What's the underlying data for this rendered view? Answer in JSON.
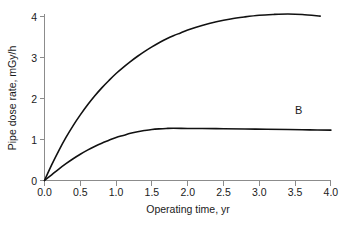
{
  "chart_data": {
    "type": "line",
    "title": "",
    "xlabel": "Operating time, yr",
    "ylabel": "Pipe dose rate, mGy/h",
    "xlim": [
      0.0,
      4.0
    ],
    "ylim": [
      0,
      4
    ],
    "grid": false,
    "legend_position": "inline-right-of-curve",
    "xticklabels": [
      "0.0",
      "0.5",
      "1.0",
      "1.5",
      "2.0",
      "2.5",
      "3.0",
      "3.5",
      "4.0"
    ],
    "xtickvalues": [
      0.0,
      0.5,
      1.0,
      1.5,
      2.0,
      2.5,
      3.0,
      3.5,
      4.0
    ],
    "yticklabels": [
      "0",
      "1",
      "2",
      "3",
      "4"
    ],
    "ytickvalues": [
      0,
      1,
      2,
      3,
      4
    ],
    "series": [
      {
        "name": "A",
        "label": "A",
        "color": "#111111",
        "x": [
          0.0,
          0.1,
          0.2,
          0.3,
          0.4,
          0.5,
          0.6,
          0.7,
          0.8,
          0.9,
          1.0,
          1.1,
          1.2,
          1.3,
          1.4,
          1.5,
          1.6,
          1.7,
          1.8,
          1.9,
          2.0,
          2.2,
          2.4,
          2.6,
          2.8,
          3.0,
          3.2,
          3.4,
          3.6,
          3.85
        ],
        "values": [
          0.0,
          0.38,
          0.73,
          1.05,
          1.34,
          1.6,
          1.84,
          2.06,
          2.26,
          2.44,
          2.61,
          2.76,
          2.9,
          3.03,
          3.15,
          3.26,
          3.36,
          3.45,
          3.53,
          3.6,
          3.67,
          3.78,
          3.87,
          3.94,
          3.99,
          4.03,
          4.05,
          4.06,
          4.05,
          4.01
        ]
      },
      {
        "name": "B",
        "label": "B",
        "color": "#111111",
        "x": [
          0.0,
          0.1,
          0.2,
          0.3,
          0.4,
          0.5,
          0.6,
          0.7,
          0.8,
          0.9,
          1.0,
          1.1,
          1.2,
          1.3,
          1.4,
          1.5,
          1.6,
          1.7,
          1.8,
          2.0,
          2.2,
          2.5,
          2.8,
          3.1,
          3.4,
          3.7,
          4.0
        ],
        "values": [
          0.0,
          0.14,
          0.28,
          0.41,
          0.53,
          0.64,
          0.74,
          0.83,
          0.91,
          0.98,
          1.05,
          1.1,
          1.15,
          1.19,
          1.22,
          1.245,
          1.26,
          1.27,
          1.275,
          1.27,
          1.268,
          1.262,
          1.256,
          1.25,
          1.243,
          1.235,
          1.228
        ]
      }
    ],
    "annotations": [
      {
        "text": "A",
        "x": 3.55,
        "y": 4.42
      },
      {
        "text": "B",
        "x": 3.55,
        "y": 1.62
      }
    ]
  }
}
